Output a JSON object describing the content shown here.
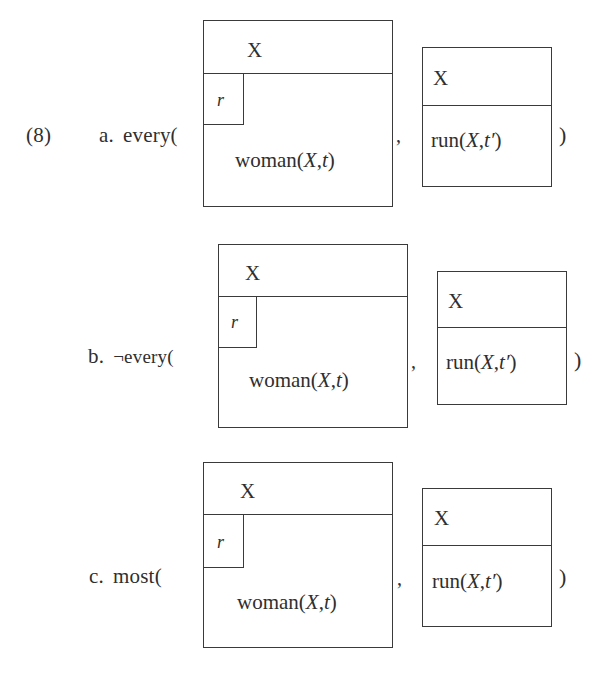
{
  "figure": {
    "example_number": "(8)",
    "notation": "drs-box",
    "items": [
      {
        "letter": "a.",
        "quantifier_label": "every(",
        "separator": ",",
        "closing": ")",
        "restrictor_box": {
          "referents": "X",
          "role_variable": "r",
          "condition": "woman(X,t)"
        },
        "scope_box": {
          "referents": "X",
          "condition": "run(X,t′)"
        }
      },
      {
        "letter": "b.",
        "quantifier_label": "¬every(",
        "separator": ",",
        "closing": ")",
        "restrictor_box": {
          "referents": "X",
          "role_variable": "r",
          "condition": "woman(X,t)"
        },
        "scope_box": {
          "referents": "X",
          "condition": "run(X,t′)"
        }
      },
      {
        "letter": "c.",
        "quantifier_label": "most(",
        "separator": ",",
        "closing": ")",
        "restrictor_box": {
          "referents": "X",
          "role_variable": "r",
          "condition": "woman(X,t)"
        },
        "scope_box": {
          "referents": "X",
          "condition": "run(X,t′)"
        }
      }
    ],
    "colors": {
      "page_background": "#ffffff",
      "ink": "#2f2f2f",
      "box_stroke": "#3a3a3a"
    }
  }
}
